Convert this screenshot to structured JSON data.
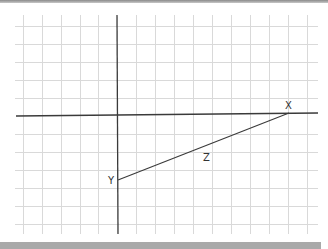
{
  "diagram": {
    "type": "coordinate-grid-triangle",
    "grid_color": "#d6d6d6",
    "axis_color": "#3a3a3a",
    "points": [
      {
        "label": "X",
        "x": 289,
        "y": 113
      },
      {
        "label": "Y",
        "x": 117,
        "y": 180
      }
    ],
    "segment_label": "Z"
  },
  "labels": {
    "x": "X",
    "y": "Y",
    "z": "Z"
  }
}
